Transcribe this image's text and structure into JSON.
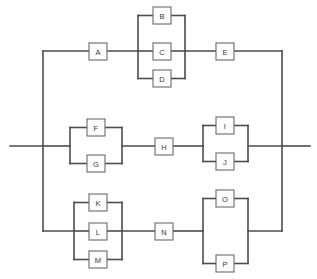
{
  "diagram": {
    "type": "reliability-block-diagram",
    "title": "",
    "canvas": {
      "width": 317,
      "height": 279
    },
    "colors": {
      "background": "#ffffff",
      "wire": "#4d4d4d",
      "block_stroke": "#6b6b6b",
      "block_fill": "#fdfdfd",
      "label_text": "#3a3a3a"
    },
    "blocks": [
      {
        "id": "A",
        "label": "A",
        "x": 89,
        "y": 43,
        "w": 18,
        "h": 17,
        "branch": "top",
        "group": "series"
      },
      {
        "id": "B",
        "label": "B",
        "x": 153,
        "y": 7,
        "w": 18,
        "h": 17,
        "branch": "top",
        "group": "BCD-parallel"
      },
      {
        "id": "C",
        "label": "C",
        "x": 153,
        "y": 43,
        "w": 18,
        "h": 17,
        "branch": "top",
        "group": "BCD-parallel"
      },
      {
        "id": "D",
        "label": "D",
        "x": 153,
        "y": 70,
        "w": 18,
        "h": 17,
        "branch": "top",
        "group": "BCD-parallel"
      },
      {
        "id": "E",
        "label": "E",
        "x": 216,
        "y": 43,
        "w": 18,
        "h": 17,
        "branch": "top",
        "group": "series"
      },
      {
        "id": "F",
        "label": "F",
        "x": 87,
        "y": 119,
        "w": 18,
        "h": 17,
        "branch": "middle",
        "group": "FG-parallel"
      },
      {
        "id": "G",
        "label": "G",
        "x": 87,
        "y": 155,
        "w": 18,
        "h": 17,
        "branch": "middle",
        "group": "FG-parallel"
      },
      {
        "id": "H",
        "label": "H",
        "x": 155,
        "y": 138,
        "w": 18,
        "h": 17,
        "branch": "middle",
        "group": "series"
      },
      {
        "id": "I",
        "label": "I",
        "x": 216,
        "y": 117,
        "w": 18,
        "h": 17,
        "branch": "middle",
        "group": "IJ-parallel"
      },
      {
        "id": "J",
        "label": "J",
        "x": 216,
        "y": 153,
        "w": 18,
        "h": 17,
        "branch": "middle",
        "group": "IJ-parallel"
      },
      {
        "id": "K",
        "label": "K",
        "x": 89,
        "y": 194,
        "w": 18,
        "h": 17,
        "branch": "bottom",
        "group": "KLM-parallel"
      },
      {
        "id": "L",
        "label": "L",
        "x": 89,
        "y": 223,
        "w": 18,
        "h": 17,
        "branch": "bottom",
        "group": "KLM-parallel"
      },
      {
        "id": "M",
        "label": "M",
        "x": 89,
        "y": 251,
        "w": 18,
        "h": 17,
        "branch": "bottom",
        "group": "KLM-parallel"
      },
      {
        "id": "N",
        "label": "N",
        "x": 155,
        "y": 223,
        "w": 18,
        "h": 17,
        "branch": "bottom",
        "group": "series"
      },
      {
        "id": "O",
        "label": "O",
        "x": 216,
        "y": 190,
        "w": 18,
        "h": 17,
        "branch": "bottom",
        "group": "OP-parallel"
      },
      {
        "id": "P",
        "label": "P",
        "x": 216,
        "y": 255,
        "w": 18,
        "h": 17,
        "branch": "bottom",
        "group": "OP-parallel"
      }
    ],
    "branch_rows": {
      "top_y": 51,
      "middle_y": 146,
      "bottom_y": 231
    },
    "bus": {
      "left_x": 43,
      "right_x": 282,
      "rail_left_end": 10,
      "rail_right_end": 310
    },
    "wires": [
      {
        "name": "input-rail",
        "d": "M 10 146 L 43 146"
      },
      {
        "name": "output-rail",
        "d": "M 282 146 L 310 146"
      },
      {
        "name": "left-bus",
        "d": "M 43 51 L 43 231"
      },
      {
        "name": "right-bus",
        "d": "M 282 51 L 282 231"
      },
      {
        "name": "top-left-lead",
        "d": "M 43 51 L 89 51"
      },
      {
        "name": "top-a-to-bcd",
        "d": "M 107 51 L 138 51"
      },
      {
        "name": "bcd-left-rail",
        "d": "M 138 15.5 L 138 78.5"
      },
      {
        "name": "bcd-right-rail",
        "d": "M 185 15.5 L 185 78.5"
      },
      {
        "name": "bcd-b-in",
        "d": "M 138 15.5 L 153 15.5"
      },
      {
        "name": "bcd-b-out",
        "d": "M 171 15.5 L 185 15.5"
      },
      {
        "name": "bcd-c-in",
        "d": "M 138 51 L 153 51"
      },
      {
        "name": "bcd-c-out",
        "d": "M 171 51 L 185 51"
      },
      {
        "name": "bcd-d-in",
        "d": "M 138 78.5 L 153 78.5"
      },
      {
        "name": "bcd-d-out",
        "d": "M 171 78.5 L 185 78.5"
      },
      {
        "name": "top-bcd-to-e",
        "d": "M 185 51 L 216 51"
      },
      {
        "name": "top-right-lead",
        "d": "M 234 51 L 282 51"
      },
      {
        "name": "mid-left-lead",
        "d": "M 43 146 L 70 146"
      },
      {
        "name": "fg-left-rail",
        "d": "M 70 127.5 L 70 163.5"
      },
      {
        "name": "fg-right-rail",
        "d": "M 122 127.5 L 122 163.5"
      },
      {
        "name": "fg-f-in",
        "d": "M 70 127.5 L 87 127.5"
      },
      {
        "name": "fg-f-out",
        "d": "M 105 127.5 L 122 127.5"
      },
      {
        "name": "fg-g-in",
        "d": "M 70 163.5 L 87 163.5"
      },
      {
        "name": "fg-g-out",
        "d": "M 105 163.5 L 122 163.5"
      },
      {
        "name": "mid-fg-to-h",
        "d": "M 122 146 L 155 146"
      },
      {
        "name": "mid-h-to-ij",
        "d": "M 173 146 L 203 146"
      },
      {
        "name": "ij-left-rail",
        "d": "M 203 125.5 L 203 161.5"
      },
      {
        "name": "ij-right-rail",
        "d": "M 248 125.5 L 248 161.5"
      },
      {
        "name": "ij-i-in",
        "d": "M 203 125.5 L 216 125.5"
      },
      {
        "name": "ij-i-out",
        "d": "M 234 125.5 L 248 125.5"
      },
      {
        "name": "ij-j-in",
        "d": "M 203 161.5 L 216 161.5"
      },
      {
        "name": "ij-j-out",
        "d": "M 234 161.5 L 248 161.5"
      },
      {
        "name": "mid-right-lead",
        "d": "M 248 146 L 282 146"
      },
      {
        "name": "bot-left-lead",
        "d": "M 43 231 L 74 231"
      },
      {
        "name": "klm-left-rail",
        "d": "M 74 202.5 L 74 259.5"
      },
      {
        "name": "klm-right-rail",
        "d": "M 122 202.5 L 122 259.5"
      },
      {
        "name": "klm-k-in",
        "d": "M 74 202.5 L 89 202.5"
      },
      {
        "name": "klm-k-out",
        "d": "M 107 202.5 L 122 202.5"
      },
      {
        "name": "klm-l-in",
        "d": "M 74 231 L 89 231"
      },
      {
        "name": "klm-l-out",
        "d": "M 107 231 L 122 231"
      },
      {
        "name": "klm-m-in",
        "d": "M 74 259.5 L 89 259.5"
      },
      {
        "name": "klm-m-out",
        "d": "M 107 259.5 L 122 259.5"
      },
      {
        "name": "bot-klm-to-n",
        "d": "M 122 231 L 155 231"
      },
      {
        "name": "bot-n-to-op",
        "d": "M 173 231 L 203 231"
      },
      {
        "name": "op-left-rail",
        "d": "M 203 198.5 L 203 263.5"
      },
      {
        "name": "op-right-rail",
        "d": "M 248 198.5 L 248 263.5"
      },
      {
        "name": "op-o-in",
        "d": "M 203 198.5 L 216 198.5"
      },
      {
        "name": "op-o-out",
        "d": "M 234 198.5 L 248 198.5"
      },
      {
        "name": "op-p-in",
        "d": "M 203 263.5 L 216 263.5"
      },
      {
        "name": "op-p-out",
        "d": "M 234 263.5 L 248 263.5"
      },
      {
        "name": "bot-right-lead",
        "d": "M 248 231 L 282 231"
      }
    ]
  }
}
